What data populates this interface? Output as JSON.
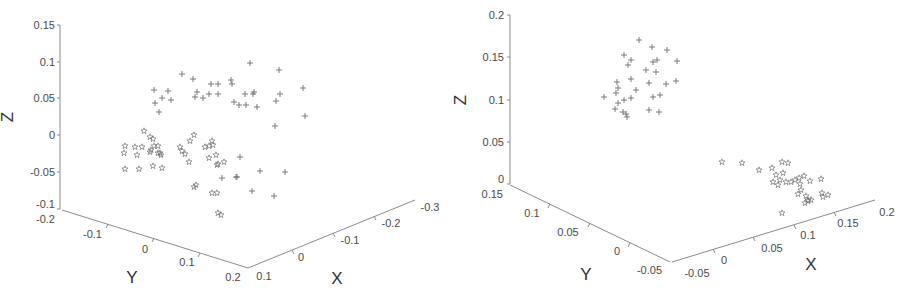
{
  "chart_data": [
    {
      "type": "scatter",
      "subtype": "3d-scatter",
      "title": "",
      "xlabel": "X",
      "ylabel": "Y",
      "zlabel": "Z",
      "xlim": [
        -0.3,
        0.1
      ],
      "ylim": [
        -0.2,
        0.2
      ],
      "zlim": [
        -0.1,
        0.15
      ],
      "x_ticks": [
        "0.1",
        "0",
        "-0.1",
        "-0.2",
        "-0.3"
      ],
      "y_ticks": [
        "-0.2",
        "-0.1",
        "0",
        "0.1",
        "0.2"
      ],
      "z_ticks": [
        "-0.1",
        "-0.05",
        "0",
        "0.05",
        "0.1",
        "0.15"
      ],
      "grid": false,
      "legend": null,
      "series": [
        {
          "name": "class-plus",
          "marker": "+",
          "screen_points": [
            [
              182,
              74
            ],
            [
              154,
              90
            ],
            [
              168,
              91
            ],
            [
              162,
              98
            ],
            [
              171,
              100
            ],
            [
              155,
              103
            ],
            [
              159,
              112
            ],
            [
              195,
              97
            ],
            [
              197,
              92
            ],
            [
              203,
              98
            ],
            [
              209,
              94
            ],
            [
              211,
              84
            ],
            [
              218,
              84
            ],
            [
              218,
              94
            ],
            [
              231,
              80
            ],
            [
              232,
              84
            ],
            [
              234,
              102
            ],
            [
              246,
              105
            ],
            [
              239,
              105
            ],
            [
              245,
              94
            ],
            [
              253,
              94
            ],
            [
              254,
              92
            ],
            [
              257,
              107
            ],
            [
              250,
              63
            ],
            [
              279,
              70
            ],
            [
              280,
              94
            ],
            [
              276,
              101
            ],
            [
              303,
              88
            ],
            [
              305,
              116
            ],
            [
              275,
              126
            ],
            [
              260,
              171
            ],
            [
              222,
              178
            ],
            [
              237,
              177
            ],
            [
              252,
              191
            ],
            [
              274,
              196
            ],
            [
              285,
              172
            ],
            [
              240,
              157
            ],
            [
              236,
              177
            ],
            [
              193,
              79
            ]
          ]
        },
        {
          "name": "class-star",
          "marker": "pentagram",
          "screen_points": [
            [
              144,
              131
            ],
            [
              150,
              137
            ],
            [
              153,
              139
            ],
            [
              125,
              146
            ],
            [
              135,
              147
            ],
            [
              142,
              147
            ],
            [
              124,
              153
            ],
            [
              137,
              155
            ],
            [
              151,
              150
            ],
            [
              154,
              146
            ],
            [
              158,
              146
            ],
            [
              158,
              153
            ],
            [
              150,
              152
            ],
            [
              160,
              153
            ],
            [
              161,
              155
            ],
            [
              125,
              169
            ],
            [
              139,
              169
            ],
            [
              153,
              166
            ],
            [
              162,
              168
            ],
            [
              180,
              147
            ],
            [
              182,
              151
            ],
            [
              185,
              154
            ],
            [
              189,
              162
            ],
            [
              190,
              141
            ],
            [
              194,
              135
            ],
            [
              205,
              147
            ],
            [
              209,
              146
            ],
            [
              212,
              141
            ],
            [
              213,
              145
            ],
            [
              216,
              155
            ],
            [
              209,
              158
            ],
            [
              217,
              165
            ],
            [
              218,
              164
            ],
            [
              224,
              162
            ],
            [
              194,
              187
            ],
            [
              196,
              185
            ],
            [
              212,
              193
            ],
            [
              217,
              193
            ],
            [
              218,
              213
            ],
            [
              221,
              215
            ]
          ]
        }
      ]
    },
    {
      "type": "scatter",
      "subtype": "3d-scatter",
      "title": "",
      "xlabel": "X",
      "ylabel": "Y",
      "zlabel": "Z",
      "xlim": [
        -0.05,
        0.2
      ],
      "ylim": [
        -0.05,
        0.15
      ],
      "zlim": [
        0,
        0.2
      ],
      "x_ticks": [
        "-0.05",
        "0",
        "0.05",
        "0.1",
        "0.15",
        "0.2"
      ],
      "y_ticks": [
        "0.15",
        "0.1",
        "0.05",
        "0",
        "-0.05"
      ],
      "z_ticks": [
        "0",
        "0.05",
        "0.1",
        "0.15",
        "0.2"
      ],
      "grid": false,
      "legend": null,
      "series": [
        {
          "name": "class-plus",
          "marker": "+",
          "screen_points": [
            [
              639,
              40
            ],
            [
              652,
              47
            ],
            [
              667,
              50
            ],
            [
              624,
              55
            ],
            [
              631,
              60
            ],
            [
              653,
              62
            ],
            [
              657,
              60
            ],
            [
              677,
              61
            ],
            [
              628,
              65
            ],
            [
              646,
              70
            ],
            [
              656,
              72
            ],
            [
              631,
              79
            ],
            [
              617,
              82
            ],
            [
              618,
              88
            ],
            [
              636,
              90
            ],
            [
              649,
              83
            ],
            [
              666,
              84
            ],
            [
              676,
              81
            ],
            [
              604,
              97
            ],
            [
              616,
              93
            ],
            [
              618,
              103
            ],
            [
              624,
              100
            ],
            [
              631,
              98
            ],
            [
              615,
              109
            ],
            [
              623,
              112
            ],
            [
              626,
              114
            ],
            [
              627,
              117
            ],
            [
              649,
              110
            ],
            [
              659,
              112
            ],
            [
              660,
              95
            ],
            [
              653,
              97
            ]
          ]
        },
        {
          "name": "class-star",
          "marker": "pentagram",
          "screen_points": [
            [
              722,
              162
            ],
            [
              742,
              163
            ],
            [
              759,
              170
            ],
            [
              772,
              168
            ],
            [
              782,
              162
            ],
            [
              788,
              163
            ],
            [
              776,
              175
            ],
            [
              783,
              173
            ],
            [
              780,
              180
            ],
            [
              786,
              182
            ],
            [
              773,
              182
            ],
            [
              778,
              185
            ],
            [
              791,
              182
            ],
            [
              795,
              180
            ],
            [
              799,
              178
            ],
            [
              800,
              184
            ],
            [
              801,
              190
            ],
            [
              804,
              176
            ],
            [
              810,
              181
            ],
            [
              821,
              179
            ],
            [
              822,
              193
            ],
            [
              806,
              196
            ],
            [
              808,
              201
            ],
            [
              805,
              203
            ],
            [
              808,
              200
            ],
            [
              811,
              200
            ],
            [
              798,
              194
            ],
            [
              823,
              197
            ],
            [
              828,
              195
            ],
            [
              782,
              213
            ]
          ]
        }
      ]
    }
  ],
  "plots": [
    {
      "axis_titles": {
        "z": "Z",
        "y": "Y",
        "x": "X"
      },
      "z_tick_labels": [
        "0.15",
        "0.1",
        "0.05",
        "0",
        "-0.05",
        "-0.1"
      ],
      "y_tick_labels": [
        "-0.2",
        "-0.1",
        "0",
        "0.1",
        "0.2"
      ],
      "x_tick_labels": [
        "0.1",
        "0",
        "-0.1",
        "-0.2",
        "-0.3"
      ]
    },
    {
      "axis_titles": {
        "z": "Z",
        "y": "Y",
        "x": "X"
      },
      "z_tick_labels": [
        "0.2",
        "0.15",
        "0.1",
        "0.05",
        "0"
      ],
      "y_tick_labels": [
        "0.15",
        "0.1",
        "0.05",
        "0",
        "-0.05"
      ],
      "x_tick_labels": [
        "-0.05",
        "0",
        "0.05",
        "0.1",
        "0.15",
        "0.2"
      ]
    }
  ]
}
